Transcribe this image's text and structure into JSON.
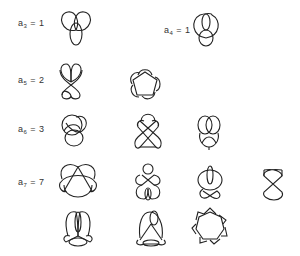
{
  "figure": {
    "rows": [
      {
        "labels": [
          {
            "prefix": "a",
            "sub": "3",
            "suffix": " = 1"
          },
          {
            "prefix": "a",
            "sub": "4",
            "suffix": " = 1"
          }
        ],
        "knots": [
          "trefoil",
          "figure-eight"
        ]
      },
      {
        "labels": [
          {
            "prefix": "a",
            "sub": "5",
            "suffix": " = 2"
          }
        ],
        "knots": [
          "knot-5-2",
          "cinquefoil-5-1"
        ]
      },
      {
        "labels": [
          {
            "prefix": "a",
            "sub": "6",
            "suffix": " = 3"
          }
        ],
        "knots": [
          "knot-6-1",
          "knot-6-2",
          "knot-6-3"
        ]
      },
      {
        "labels": [
          {
            "prefix": "a",
            "sub": "7",
            "suffix": " = 7"
          }
        ],
        "knots": [
          "knot-7-a",
          "knot-7-b",
          "knot-7-c",
          "knot-7-d",
          "knot-7-e",
          "knot-7-f",
          "septafoil-7-1"
        ]
      }
    ],
    "stroke_color": "#222222",
    "background": "#ffffff"
  }
}
